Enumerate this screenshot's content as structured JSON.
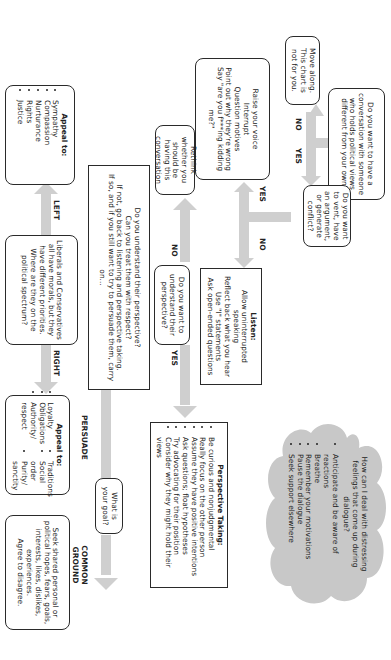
{
  "start": {
    "question": "Do you want to have a conversation with someone who holds political views different from your own?",
    "no_label": "NO",
    "yes_label": "YES"
  },
  "move_along": {
    "text": "Move along. This chart is not for you."
  },
  "vent": {
    "question": "Do you want to vent, have an argument, or generate conflict?",
    "yes_label": "YES",
    "no_label": "NO"
  },
  "conflict_actions": {
    "lines": [
      "Raise your voice",
      "Interrupt",
      "Question motives",
      "Point out why they're wrong",
      "Say \"are you f***ing kidding me?\""
    ]
  },
  "listen": {
    "title": "Listen:",
    "lines": [
      "Allow uninterrupted speaking",
      "Reflect back what you hear",
      "Use \"I\" statements",
      "Ask open-ended questions"
    ]
  },
  "understand_q": {
    "question": "Do you want to understand their perspective?",
    "no_label": "NO",
    "yes_label": "YES"
  },
  "rethink": {
    "text": "Rethink whether you should be having this conversation"
  },
  "check": {
    "lines": [
      "Do you understand their perspective?",
      "Can you treat them with respect?",
      "If not, go back to listening and perspective taking.",
      "If so, and if you still want to try to persuade them, carry on..."
    ]
  },
  "spectrum": {
    "text": "Liberals and Conservatives all have morals, but they have different priorities. Where are they on the political spectrum?",
    "left_label": "LEFT",
    "right_label": "RIGHT"
  },
  "appeal_left": {
    "title": "Appeal to:",
    "items": [
      "Sympathy",
      "Compassion",
      "Nurturance",
      "Rights",
      "Justice"
    ]
  },
  "appeal_right": {
    "title": "Appeal to:",
    "col1": [
      "Loyalty",
      "Obligations",
      "Authority/ respect"
    ],
    "col2": [
      "Traditions",
      "Social order",
      "Purity/ sanctity"
    ]
  },
  "perspective_taking": {
    "title": "Perspective Taking:",
    "items": [
      "Be curious and nonjudgmental",
      "Really focus on the other person",
      "Assume they have positive intentions",
      "Ask questions; float hypotheses",
      "Try advocating for their position",
      "Consider why they might hold their views"
    ]
  },
  "goal": {
    "question": "What is your goal?",
    "persuade_label": "PERSUADE",
    "common_ground_label": "COMMON GROUND"
  },
  "common_ground": {
    "text": "Seek shared personal or political hopes, fears, goals, interests, likes, dislikes, experiences.",
    "agree": "Agree to disagree."
  },
  "feelings_cloud": {
    "question": "How can I deal with distressing feelings that come up during dialogue?",
    "items": [
      "Anticipate and be aware of reactions",
      "Breathe",
      "Remember your motivations",
      "Pause the dialogue",
      "Seek support elsewhere"
    ]
  },
  "colors": {
    "arrow": "#cfcfcf",
    "cloud": "#c8c8c8",
    "border": "#2a2a2a"
  }
}
